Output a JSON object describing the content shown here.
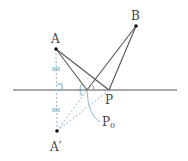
{
  "diagram": {
    "type": "geometry-reflection",
    "points": {
      "A": {
        "label": "A",
        "x": 56,
        "y": 49
      },
      "B": {
        "label": "B",
        "x": 136,
        "y": 26
      },
      "P": {
        "label": "P",
        "x": 109,
        "y": 90
      },
      "P0": {
        "label": "P",
        "subscript": "0",
        "x": 87,
        "y": 90
      },
      "A_prime": {
        "label": "A′",
        "x": 57,
        "y": 131
      }
    },
    "line": {
      "x1": 13,
      "y1": 90,
      "x2": 177,
      "y2": 90
    },
    "colors": {
      "solid_line": "#555555",
      "dashed_line": "#8fb8d0",
      "point": "#111111",
      "marks": "#7aa8c4"
    }
  }
}
